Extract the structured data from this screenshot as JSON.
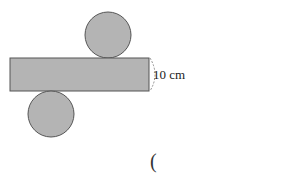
{
  "diagram": {
    "type": "cylinder-net",
    "colors": {
      "fill": "#b4b4b4",
      "stroke": "#555555",
      "background": "#ffffff"
    },
    "rectangle": {
      "x": 10,
      "y": 58,
      "width": 139,
      "height": 33
    },
    "top_circle": {
      "cx": 108,
      "cy": 35,
      "r": 23
    },
    "bottom_circle": {
      "cx": 51,
      "cy": 114,
      "r": 23
    },
    "dimension": {
      "label": "10 cm",
      "applies_to": "rectangle height"
    },
    "answer_bracket": "("
  }
}
